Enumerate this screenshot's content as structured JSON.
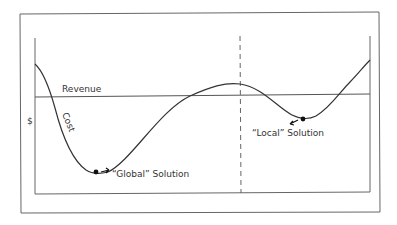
{
  "figure": {
    "y_axis_label": "$",
    "revenue_label": "Revenue",
    "cost_label": "Cost",
    "global_label": "“Global” Solution",
    "local_label": "“Local” Solution"
  },
  "colors": {
    "line": "#333333",
    "frame": "#555555"
  }
}
